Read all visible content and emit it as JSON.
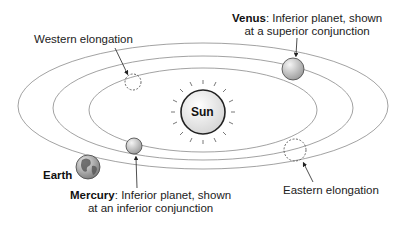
{
  "diagram": {
    "sun": {
      "label": "Sun"
    },
    "earth": {
      "label": "Earth"
    },
    "venus": {
      "name": "Venus",
      "desc": ": Inferior planet, shown",
      "line2": "at a superior conjunction"
    },
    "mercury": {
      "name": "Mercury",
      "desc": ": Inferior planet, shown",
      "line2": "at an inferior conjunction"
    },
    "western_elongation": {
      "label": "Western elongation"
    },
    "eastern_elongation": {
      "label": "Eastern elongation"
    }
  },
  "colors": {
    "orbit": "#8a8a8a",
    "outline": "#333333",
    "text": "#222222",
    "background": "#ffffff"
  }
}
